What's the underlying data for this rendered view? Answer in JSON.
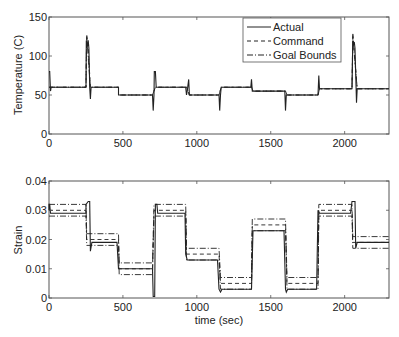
{
  "chart_data": [
    {
      "type": "line",
      "title": "",
      "xlabel": "",
      "ylabel": "Temperature (C)",
      "xlim": [
        0,
        2300
      ],
      "ylim": [
        0,
        150
      ],
      "xticks": [
        0,
        500,
        1000,
        1500,
        2000
      ],
      "yticks": [
        0,
        50,
        100,
        150
      ],
      "grid": false,
      "legend": {
        "position": "upper-right",
        "entries": [
          "Actual",
          "Command",
          "Goal Bounds"
        ]
      },
      "series": [
        {
          "name": "Actual",
          "style": "solid",
          "points": [
            [
              0,
              80
            ],
            [
              5,
              80
            ],
            [
              10,
              55
            ],
            [
              15,
              60
            ],
            [
              250,
              60
            ],
            [
              252,
              120
            ],
            [
              258,
              110
            ],
            [
              265,
              120
            ],
            [
              270,
              110
            ],
            [
              275,
              60
            ],
            [
              280,
              45
            ],
            [
              285,
              60
            ],
            [
              470,
              60
            ],
            [
              470,
              50
            ],
            [
              700,
              50
            ],
            [
              705,
              30
            ],
            [
              710,
              50
            ],
            [
              712,
              80
            ],
            [
              720,
              80
            ],
            [
              725,
              60
            ],
            [
              925,
              60
            ],
            [
              930,
              50
            ],
            [
              935,
              55
            ],
            [
              945,
              70
            ],
            [
              950,
              50
            ],
            [
              1150,
              50
            ],
            [
              1155,
              30
            ],
            [
              1160,
              50
            ],
            [
              1165,
              60
            ],
            [
              1365,
              60
            ],
            [
              1370,
              70
            ],
            [
              1375,
              55
            ],
            [
              1380,
              55
            ],
            [
              1595,
              55
            ],
            [
              1600,
              30
            ],
            [
              1605,
              50
            ],
            [
              1610,
              50
            ],
            [
              1820,
              50
            ],
            [
              1825,
              75
            ],
            [
              1830,
              58
            ],
            [
              2050,
              58
            ],
            [
              2055,
              120
            ],
            [
              2060,
              115
            ],
            [
              2065,
              118
            ],
            [
              2070,
              110
            ],
            [
              2080,
              40
            ],
            [
              2085,
              58
            ],
            [
              2300,
              58
            ]
          ]
        },
        {
          "name": "Command",
          "style": "dashed",
          "points": [
            [
              0,
              60
            ],
            [
              250,
              60
            ],
            [
              255,
              128
            ],
            [
              265,
              110
            ],
            [
              280,
              60
            ],
            [
              470,
              60
            ],
            [
              470,
              50
            ],
            [
              700,
              50
            ],
            [
              720,
              60
            ],
            [
              930,
              60
            ],
            [
              950,
              50
            ],
            [
              1150,
              50
            ],
            [
              1165,
              60
            ],
            [
              1370,
              60
            ],
            [
              1380,
              55
            ],
            [
              1600,
              55
            ],
            [
              1610,
              50
            ],
            [
              1820,
              50
            ],
            [
              1830,
              58
            ],
            [
              2050,
              58
            ],
            [
              2055,
              130
            ],
            [
              2085,
              58
            ],
            [
              2300,
              58
            ]
          ]
        },
        {
          "name": "Goal Bounds",
          "style": "dashdot",
          "points": [
            [
              0,
              60
            ],
            [
              250,
              60
            ],
            [
              255,
              125
            ],
            [
              280,
              60
            ],
            [
              470,
              60
            ],
            [
              470,
              50
            ],
            [
              700,
              50
            ],
            [
              720,
              60
            ],
            [
              930,
              60
            ],
            [
              950,
              50
            ],
            [
              1150,
              50
            ],
            [
              1165,
              60
            ],
            [
              1370,
              60
            ],
            [
              1380,
              55
            ],
            [
              1600,
              55
            ],
            [
              1610,
              50
            ],
            [
              1820,
              50
            ],
            [
              1830,
              58
            ],
            [
              2050,
              58
            ],
            [
              2055,
              125
            ],
            [
              2085,
              58
            ],
            [
              2300,
              58
            ]
          ]
        }
      ]
    },
    {
      "type": "line",
      "title": "",
      "xlabel": "time (sec)",
      "ylabel": "Strain",
      "xlim": [
        0,
        2300
      ],
      "ylim": [
        0,
        0.04
      ],
      "xticks": [
        0,
        500,
        1000,
        1500,
        2000
      ],
      "yticks": [
        0,
        0.01,
        0.02,
        0.03,
        0.04
      ],
      "grid": false,
      "series": [
        {
          "name": "Actual",
          "style": "solid",
          "points": [
            [
              0,
              0.03
            ],
            [
              0,
              0.032
            ],
            [
              5,
              0.032
            ],
            [
              10,
              0.029
            ],
            [
              250,
              0.029
            ],
            [
              250,
              0.032
            ],
            [
              265,
              0.033
            ],
            [
              275,
              0.033
            ],
            [
              280,
              0.016
            ],
            [
              290,
              0.019
            ],
            [
              460,
              0.019
            ],
            [
              470,
              0.01
            ],
            [
              690,
              0.01
            ],
            [
              700,
              0.01
            ],
            [
              705,
              0.0005
            ],
            [
              715,
              0.0005
            ],
            [
              720,
              0.032
            ],
            [
              730,
              0.032
            ],
            [
              735,
              0.029
            ],
            [
              920,
              0.029
            ],
            [
              925,
              0.015
            ],
            [
              935,
              0.013
            ],
            [
              1140,
              0.013
            ],
            [
              1150,
              0.003
            ],
            [
              1160,
              0.002
            ],
            [
              1170,
              0.003
            ],
            [
              1370,
              0.003
            ],
            [
              1380,
              0.023
            ],
            [
              1390,
              0.023
            ],
            [
              1590,
              0.023
            ],
            [
              1600,
              0.003
            ],
            [
              1605,
              0.002
            ],
            [
              1615,
              0.003
            ],
            [
              1810,
              0.003
            ],
            [
              1820,
              0.03
            ],
            [
              1830,
              0.029
            ],
            [
              2040,
              0.029
            ],
            [
              2050,
              0.033
            ],
            [
              2070,
              0.033
            ],
            [
              2075,
              0.017
            ],
            [
              2085,
              0.019
            ],
            [
              2300,
              0.019
            ]
          ]
        },
        {
          "name": "Command",
          "style": "dashed",
          "points": [
            [
              0,
              0.03
            ],
            [
              250,
              0.03
            ],
            [
              255,
              0.02
            ],
            [
              470,
              0.02
            ],
            [
              475,
              0.01
            ],
            [
              700,
              0.01
            ],
            [
              710,
              0.03
            ],
            [
              925,
              0.03
            ],
            [
              930,
              0.015
            ],
            [
              1150,
              0.015
            ],
            [
              1160,
              0.005
            ],
            [
              1370,
              0.005
            ],
            [
              1375,
              0.025
            ],
            [
              1600,
              0.025
            ],
            [
              1610,
              0.005
            ],
            [
              1820,
              0.005
            ],
            [
              1825,
              0.03
            ],
            [
              2050,
              0.03
            ],
            [
              2055,
              0.019
            ],
            [
              2300,
              0.019
            ]
          ]
        },
        {
          "name": "Goal Bounds Upper",
          "style": "dashdot",
          "points": [
            [
              0,
              0.032
            ],
            [
              250,
              0.032
            ],
            [
              255,
              0.022
            ],
            [
              470,
              0.022
            ],
            [
              475,
              0.012
            ],
            [
              700,
              0.012
            ],
            [
              710,
              0.032
            ],
            [
              925,
              0.032
            ],
            [
              930,
              0.017
            ],
            [
              1150,
              0.017
            ],
            [
              1160,
              0.007
            ],
            [
              1370,
              0.007
            ],
            [
              1375,
              0.027
            ],
            [
              1600,
              0.027
            ],
            [
              1610,
              0.007
            ],
            [
              1820,
              0.007
            ],
            [
              1825,
              0.032
            ],
            [
              2050,
              0.032
            ],
            [
              2055,
              0.021
            ],
            [
              2300,
              0.021
            ]
          ]
        },
        {
          "name": "Goal Bounds Lower",
          "style": "dashdot",
          "points": [
            [
              0,
              0.028
            ],
            [
              250,
              0.028
            ],
            [
              255,
              0.018
            ],
            [
              470,
              0.018
            ],
            [
              475,
              0.008
            ],
            [
              700,
              0.008
            ],
            [
              710,
              0.028
            ],
            [
              925,
              0.028
            ],
            [
              930,
              0.013
            ],
            [
              1150,
              0.013
            ],
            [
              1160,
              0.003
            ],
            [
              1370,
              0.003
            ],
            [
              1375,
              0.023
            ],
            [
              1600,
              0.023
            ],
            [
              1610,
              0.003
            ],
            [
              1820,
              0.003
            ],
            [
              1825,
              0.028
            ],
            [
              2050,
              0.028
            ],
            [
              2055,
              0.017
            ],
            [
              2300,
              0.017
            ]
          ]
        }
      ]
    }
  ],
  "labels": {
    "top_ylabel": "Temperature (C)",
    "bottom_ylabel": "Strain",
    "bottom_xlabel": "time (sec)",
    "legend_actual": "Actual",
    "legend_command": "Command",
    "legend_goal": "Goal Bounds",
    "top_yticks": [
      "0",
      "50",
      "100",
      "150"
    ],
    "bottom_yticks": [
      "0",
      "0.01",
      "0.02",
      "0.03",
      "0.04"
    ],
    "xticks": [
      "0",
      "500",
      "1000",
      "1500",
      "2000"
    ]
  }
}
